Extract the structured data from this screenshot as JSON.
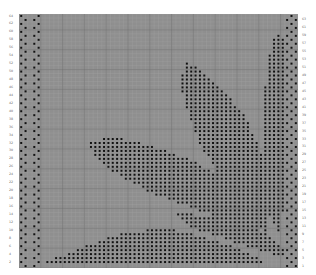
{
  "chart": {
    "rows": 64,
    "cols": 64,
    "grid_color": "#8f8f8f",
    "line_color": "#a2a2a2",
    "major_line_color": "#6e6e6e",
    "stitch_color": "#111111",
    "edge_fill": "#9a9a9a",
    "left_row_labels": [
      64,
      62,
      60,
      58,
      56,
      54,
      52,
      50,
      48,
      46,
      44,
      42,
      40,
      38,
      36,
      34,
      32,
      30,
      28,
      26,
      24,
      22,
      20,
      18,
      16,
      14,
      12,
      10,
      8,
      6,
      4,
      2
    ],
    "right_row_labels": [
      63,
      61,
      59,
      57,
      55,
      53,
      51,
      49,
      47,
      45,
      43,
      41,
      39,
      37,
      35,
      33,
      31,
      29,
      27,
      25,
      23,
      21,
      19,
      17,
      15,
      13,
      11,
      9,
      7,
      5,
      3,
      1
    ],
    "shapes": {
      "left_border": {
        "cols": [
          0,
          4
        ],
        "pattern": "checker"
      },
      "right_border": {
        "cols": [
          61,
          63
        ],
        "pattern": "checker"
      },
      "big_leaf": {
        "description": "diagonal leaf from upper-left (col 16,row 32) to lower-right (col 55,row 10)"
      },
      "tall_leaf": {
        "description": "tall leaf from top (col 37,row 52) down to lower-right (col 56,row 8)"
      },
      "right_leaf": {
        "description": "narrow leaf along right (col 57-60,row 59 to row 6)"
      },
      "bottom_leaf": {
        "description": "low arc leaf along bottom (col 6-52,rows 1-10)"
      },
      "lower_band": {
        "description": "leaf band from col 36,row 14 to col 60,row 4"
      }
    }
  }
}
